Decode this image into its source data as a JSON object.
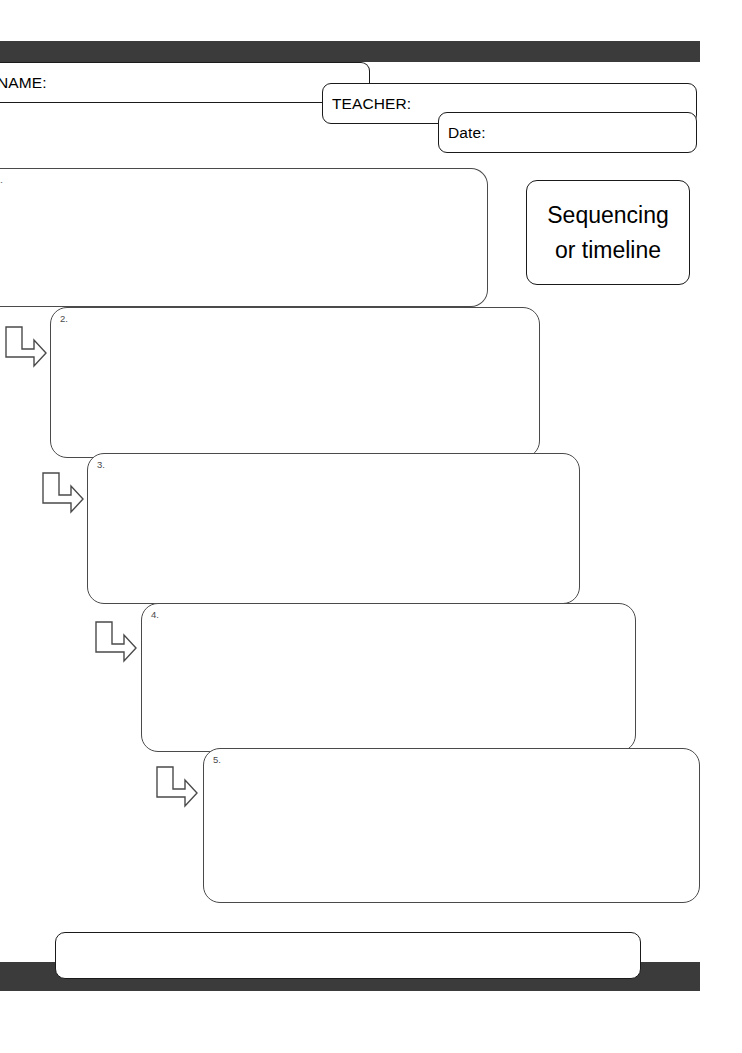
{
  "page": {
    "width": 742,
    "height": 1053,
    "background": "#ffffff",
    "accent_bar_color": "#3b3b3b",
    "box_outline_color": "#4a4a4a",
    "field_outline_color": "#1a1a1a"
  },
  "header": {
    "name_field": {
      "label": "NAME:",
      "value": ""
    },
    "teacher_field": {
      "label": "TEACHER:",
      "value": ""
    },
    "date_field": {
      "label": "Date:",
      "value": ""
    }
  },
  "title_card": {
    "line1": "Sequencing",
    "line2": "or timeline"
  },
  "steps": [
    {
      "number": "1.",
      "content": ""
    },
    {
      "number": "2.",
      "content": ""
    },
    {
      "number": "3.",
      "content": ""
    },
    {
      "number": "4.",
      "content": ""
    },
    {
      "number": "5.",
      "content": ""
    }
  ],
  "connectors": [
    {
      "icon": "elbow-arrow-icon",
      "from": "1.",
      "to": "2."
    },
    {
      "icon": "elbow-arrow-icon",
      "from": "2.",
      "to": "3."
    },
    {
      "icon": "elbow-arrow-icon",
      "from": "3.",
      "to": "4."
    },
    {
      "icon": "elbow-arrow-icon",
      "from": "4.",
      "to": "5."
    }
  ],
  "footer": {
    "note_box": {
      "content": ""
    }
  }
}
